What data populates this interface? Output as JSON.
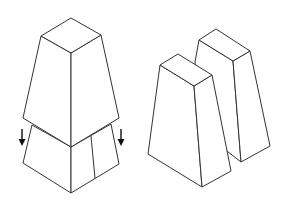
{
  "diagram": {
    "type": "isometric line drawing",
    "background": "#ffffff",
    "stroke_color": "#333333",
    "arrow_color": "#111111",
    "figures": [
      {
        "id": "assembled-tower",
        "description": "Tapered block seated on a lower base block, with downward arrows on each side",
        "parts": [
          "upper-tapered-block",
          "lower-base-block"
        ],
        "arrows": [
          {
            "id": "left-down-arrow",
            "direction": "down"
          },
          {
            "id": "right-down-arrow",
            "direction": "down"
          }
        ]
      },
      {
        "id": "split-blocks",
        "description": "Two tapered blocks standing side by side, one offset behind the other",
        "parts": [
          "front-tapered-block",
          "back-tapered-block"
        ]
      }
    ]
  }
}
